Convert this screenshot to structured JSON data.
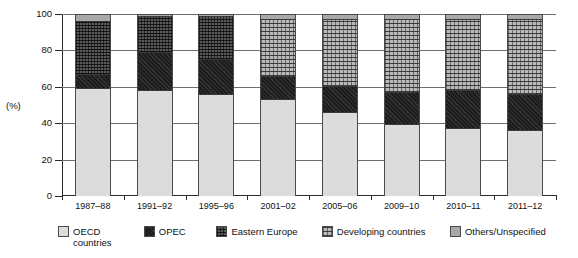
{
  "chart_data": {
    "type": "bar",
    "subtype": "stacked-100-percent",
    "title": "",
    "xlabel": "",
    "ylabel": "(%)",
    "ylim": [
      0,
      100
    ],
    "yticks": [
      0,
      20,
      40,
      60,
      80,
      100
    ],
    "grid": true,
    "legend_position": "bottom",
    "categories": [
      "1987–88",
      "1991–92",
      "1995–96",
      "2001–02",
      "2005–06",
      "2009–10",
      "2010–11",
      "2011–12"
    ],
    "series": [
      {
        "name": "OECD countries",
        "key": "oecd",
        "color": "#dcdcdc",
        "pattern": "solid-light",
        "values": [
          59,
          58,
          56,
          53,
          46,
          39,
          37,
          36
        ]
      },
      {
        "name": "OPEC",
        "key": "opec",
        "color": "#1d1d1d",
        "pattern": "solid-black",
        "values": [
          8,
          21,
          19,
          13,
          14,
          18,
          21,
          20
        ]
      },
      {
        "name": "Eastern Europe",
        "key": "ee",
        "color": "#5a5a5a",
        "pattern": "cross-hatch",
        "values": [
          29,
          20,
          24,
          0,
          0,
          0,
          0,
          0
        ]
      },
      {
        "name": "Developing countries",
        "key": "dev",
        "color": "#b9b9b9",
        "pattern": "dotted",
        "values": [
          0,
          0,
          0,
          31,
          37,
          40,
          39,
          41
        ]
      },
      {
        "name": "Others/Unspecified",
        "key": "other",
        "color": "#a8a8a8",
        "pattern": "solid-mid",
        "values": [
          4,
          1,
          1,
          3,
          3,
          3,
          3,
          3
        ]
      }
    ]
  },
  "legend": {
    "items": [
      {
        "label": "OECD\ncountries",
        "key": "oecd",
        "class": "li-oecd"
      },
      {
        "label": "OPEC",
        "key": "opec",
        "class": "li-opec"
      },
      {
        "label": "Eastern Europe",
        "key": "ee",
        "class": "li-ee"
      },
      {
        "label": "Developing countries",
        "key": "dev",
        "class": "li-dev"
      },
      {
        "label": "Others/Unspecified",
        "key": "other",
        "class": "li-other"
      }
    ]
  },
  "axis": {
    "y_title": "(%)",
    "y_tick_labels": [
      "100",
      "80",
      "60",
      "40",
      "20",
      "0"
    ]
  }
}
